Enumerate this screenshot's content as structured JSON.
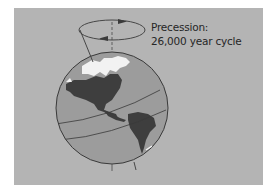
{
  "diagram": {
    "title_line1": "Precession:",
    "title_line2": "26,000 year cycle",
    "elements": [
      "globe",
      "tilted-axis",
      "vertical-reference-axis",
      "precession-circle-with-arrows"
    ]
  },
  "colors": {
    "background_panel": "#b4b4b4",
    "ocean": "#9c9c9c",
    "land": "#3e3e3e",
    "ice": "#f2f2f2",
    "lines": "#3a3a3a",
    "text": "#262626"
  }
}
